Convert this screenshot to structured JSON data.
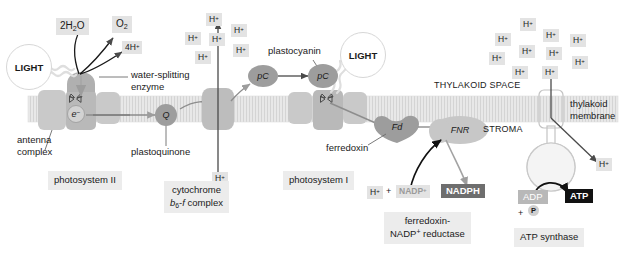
{
  "figure": {
    "compartments": {
      "thylakoid_space": "THYLAKOID SPACE",
      "stroma": "STROMA",
      "membrane": "thylakoid\nmembrane",
      "membrane_line1": "thylakoid",
      "membrane_line2": "membrane"
    },
    "light_labels": {
      "left": "LIGHT",
      "right": "LIGHT"
    },
    "species": {
      "water": "2H2O",
      "oxygen": "O2",
      "four_protons": "4H+",
      "proton": "H+",
      "nadp_plus": "NADP+",
      "nadph": "NADPH",
      "adp": "ADP",
      "phosphate": "P",
      "atp": "ATP",
      "plus": "+"
    },
    "carriers": {
      "electron": "e-",
      "quinone": "Q",
      "plastocyanin_short": "pC",
      "ferredoxin_short": "Fd",
      "reductase_short": "FNR"
    },
    "callouts": {
      "water_splitting_enzyme_line1": "water-splitting",
      "water_splitting_enzyme_line2": "enzyme",
      "antenna_complex_line1": "antenna",
      "antenna_complex_line2": "complex",
      "plastoquinone": "plastoquinone",
      "plastocyanin": "plastocyanin",
      "ferredoxin": "ferredoxin"
    },
    "captions": {
      "photosystem_ii": "photosystem II",
      "cytochrome_line1": "cytochrome",
      "cytochrome_line2_italic_b": "b",
      "cytochrome_line2_sub": "6",
      "cytochrome_line2_italic_f": "f",
      "cytochrome_line2_rest": " complex",
      "photosystem_i": "photosystem I",
      "fnr_line1": "ferredoxin-",
      "fnr_line2": "NADP+ reductase",
      "atp_synthase": "ATP synthase"
    },
    "proton_clusters": {
      "lumen_left": {
        "count": 5,
        "items": [
          {
            "label": "H+",
            "x": 206,
            "y": 13
          },
          {
            "label": "H+",
            "x": 185,
            "y": 32
          },
          {
            "label": "H+",
            "x": 209,
            "y": 33
          },
          {
            "label": "H+",
            "x": 231,
            "y": 24
          },
          {
            "label": "H+",
            "x": 195,
            "y": 51
          },
          {
            "label": "H+",
            "x": 233,
            "y": 44
          }
        ]
      },
      "lumen_right": {
        "count": 10,
        "items": [
          {
            "label": "H+",
            "x": 520,
            "y": 18
          },
          {
            "label": "H+",
            "x": 495,
            "y": 33
          },
          {
            "label": "H+",
            "x": 543,
            "y": 29
          },
          {
            "label": "H+",
            "x": 570,
            "y": 34
          },
          {
            "label": "H+",
            "x": 519,
            "y": 45
          },
          {
            "label": "H+",
            "x": 489,
            "y": 52
          },
          {
            "label": "H+",
            "x": 546,
            "y": 47
          },
          {
            "label": "H+",
            "x": 572,
            "y": 56
          },
          {
            "label": "H+",
            "x": 512,
            "y": 66
          },
          {
            "label": "H+",
            "x": 542,
            "y": 66
          }
        ]
      }
    },
    "colors": {
      "membrane": "#e6e6e6",
      "complex": "#c4c4c4",
      "carrier": "#9d9d9d",
      "chip_light": "#e3e3e3",
      "chip_dark": "#6e6e6e",
      "chip_black": "#111111",
      "caption_bg": "#ececec",
      "stroke": "#4a4a4a"
    }
  }
}
